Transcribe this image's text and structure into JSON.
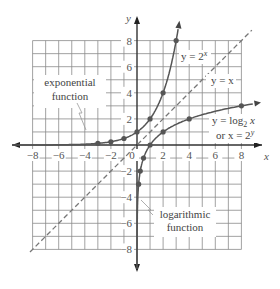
{
  "chart_data": {
    "type": "line",
    "title": "",
    "xlabel": "x",
    "ylabel": "y",
    "xlim": [
      -8,
      8
    ],
    "ylim": [
      -8,
      8
    ],
    "grid": true,
    "x_ticks": [
      -8,
      -6,
      -4,
      -2,
      0,
      2,
      4,
      6,
      8
    ],
    "y_ticks": [
      8,
      6,
      4,
      2,
      -2,
      -4,
      -6,
      -8
    ],
    "x_tick_labels": [
      "−8",
      "−6",
      "−4",
      "−2",
      "0",
      "2",
      "4",
      "6",
      "8"
    ],
    "y_tick_labels": [
      "8",
      "6",
      "4",
      "2",
      "−2",
      "−4",
      "−6",
      "−8"
    ],
    "series": [
      {
        "name": "exponential",
        "equation": "y = 2^x",
        "style": "solid",
        "points": [
          [
            -3,
            0.125
          ],
          [
            -2,
            0.25
          ],
          [
            -1,
            0.5
          ],
          [
            0,
            1
          ],
          [
            1,
            2
          ],
          [
            2,
            4
          ],
          [
            3,
            8
          ]
        ]
      },
      {
        "name": "identity",
        "equation": "y = x",
        "style": "dashed",
        "x_range": [
          -8,
          8
        ]
      },
      {
        "name": "logarithmic",
        "equation": "y = log2 x",
        "style": "solid",
        "points": [
          [
            0.125,
            -3
          ],
          [
            0.25,
            -2
          ],
          [
            0.5,
            -1
          ],
          [
            1,
            0
          ],
          [
            2,
            1
          ],
          [
            4,
            2
          ],
          [
            8,
            3
          ]
        ]
      }
    ],
    "annotations": {
      "exp_eq_prefix": "y = 2",
      "exp_eq_sup": "x",
      "id_eq": "y = x",
      "log_eq_line1_prefix": "y = log",
      "log_eq_line1_sub": "2",
      "log_eq_line1_suffix": " x",
      "log_eq_line2_prefix": "or x = 2",
      "log_eq_line2_sup": "y",
      "exp_label_line1": "exponential",
      "exp_label_line2": "function",
      "log_label_line1": "logarithmic",
      "log_label_line2": "function"
    }
  }
}
